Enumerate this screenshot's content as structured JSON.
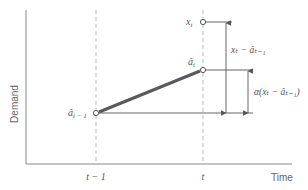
{
  "diagram": {
    "y_axis_label": "Demand",
    "x_axis_label": "Time",
    "x_ticks": {
      "t_minus_1": "t − 1",
      "t": "t"
    },
    "points": {
      "x_t": {
        "label_main": "x",
        "label_sub": "t"
      },
      "a_hat_t": {
        "label_main": "â",
        "label_sub": "t"
      },
      "a_hat_t_minus_1": {
        "label_main": "â",
        "label_sub": "t − 1"
      }
    },
    "annotations": {
      "error": "xₜ − âₜ₋₁",
      "smoothed_adjustment": "α(xₜ − âₜ₋₁)"
    },
    "colors": {
      "axis": "#8a8a8a",
      "line": "#555555",
      "trend_line": "#5a5a5a",
      "dashed": "#aaaaaa",
      "text": "#555555"
    }
  }
}
